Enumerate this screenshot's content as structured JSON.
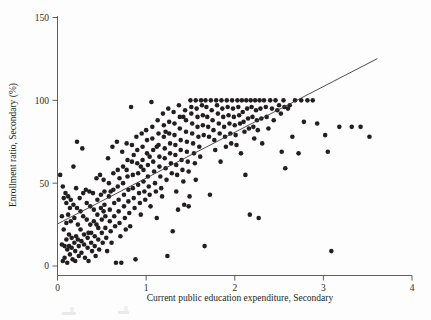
{
  "figure": {
    "name": "scatter-enrollment-vs-expenditure",
    "background": "#fdfdfd",
    "point_color": "#231f20",
    "axis_color": "#4d4d4d",
    "fit_line_color": "#3a3a3a"
  },
  "chart_data": {
    "type": "scatter",
    "title": "",
    "xlabel": "Current public education expenditure, Secondary",
    "ylabel": "Enrollment ratio, Secondary (%)",
    "xlim": [
      0,
      4
    ],
    "ylim": [
      0,
      150
    ],
    "xticks": [
      0,
      1,
      2,
      3,
      4
    ],
    "yticks": [
      0,
      50,
      100,
      150
    ],
    "xtick_labels": [
      "0",
      "1",
      "2",
      "3",
      "4"
    ],
    "ytick_labels": [
      "0",
      "50",
      "100",
      "150"
    ],
    "grid": false,
    "legend": null,
    "marker": {
      "shape": "circle",
      "size_px": 4.6,
      "color": "#231f20"
    },
    "fit_line": {
      "type": "linear",
      "x_start": 0.0,
      "y_start": 25.4,
      "x_end": 3.61,
      "y_end": 125.2,
      "slope": 27.6,
      "intercept": 25.4
    },
    "n_points": 338,
    "points": [
      [
        0.03,
        55
      ],
      [
        0.05,
        30
      ],
      [
        0.05,
        13
      ],
      [
        0.06,
        3
      ],
      [
        0.07,
        41
      ],
      [
        0.07,
        22
      ],
      [
        0.08,
        12
      ],
      [
        0.08,
        5
      ],
      [
        0.09,
        44
      ],
      [
        0.1,
        38
      ],
      [
        0.1,
        26
      ],
      [
        0.1,
        16
      ],
      [
        0.11,
        10
      ],
      [
        0.11,
        2
      ],
      [
        0.12,
        42
      ],
      [
        0.12,
        31
      ],
      [
        0.13,
        19
      ],
      [
        0.13,
        12
      ],
      [
        0.14,
        7
      ],
      [
        0.15,
        40
      ],
      [
        0.15,
        27
      ],
      [
        0.16,
        17
      ],
      [
        0.16,
        11
      ],
      [
        0.17,
        4
      ],
      [
        0.18,
        60
      ],
      [
        0.18,
        37
      ],
      [
        0.19,
        29
      ],
      [
        0.19,
        14
      ],
      [
        0.2,
        9
      ],
      [
        0.2,
        3
      ],
      [
        0.21,
        47
      ],
      [
        0.22,
        75
      ],
      [
        0.22,
        35
      ],
      [
        0.23,
        25
      ],
      [
        0.23,
        16
      ],
      [
        0.24,
        12
      ],
      [
        0.24,
        6
      ],
      [
        0.25,
        41
      ],
      [
        0.26,
        33
      ],
      [
        0.26,
        22
      ],
      [
        0.27,
        15
      ],
      [
        0.27,
        8
      ],
      [
        0.28,
        71
      ],
      [
        0.29,
        44
      ],
      [
        0.29,
        30
      ],
      [
        0.3,
        19
      ],
      [
        0.3,
        13
      ],
      [
        0.31,
        5
      ],
      [
        0.32,
        46
      ],
      [
        0.33,
        38
      ],
      [
        0.33,
        28
      ],
      [
        0.34,
        17
      ],
      [
        0.34,
        11
      ],
      [
        0.35,
        3
      ],
      [
        0.36,
        45
      ],
      [
        0.37,
        36
      ],
      [
        0.37,
        25
      ],
      [
        0.38,
        20
      ],
      [
        0.38,
        14
      ],
      [
        0.39,
        9
      ],
      [
        0.4,
        44
      ],
      [
        0.41,
        34
      ],
      [
        0.41,
        27
      ],
      [
        0.42,
        18
      ],
      [
        0.42,
        12
      ],
      [
        0.43,
        6
      ],
      [
        0.44,
        53
      ],
      [
        0.45,
        40
      ],
      [
        0.45,
        31
      ],
      [
        0.46,
        23
      ],
      [
        0.46,
        16
      ],
      [
        0.47,
        10
      ],
      [
        0.48,
        55
      ],
      [
        0.49,
        43
      ],
      [
        0.49,
        35
      ],
      [
        0.5,
        28
      ],
      [
        0.5,
        20
      ],
      [
        0.51,
        14
      ],
      [
        0.52,
        52
      ],
      [
        0.53,
        45
      ],
      [
        0.53,
        37
      ],
      [
        0.54,
        30
      ],
      [
        0.54,
        23
      ],
      [
        0.55,
        17
      ],
      [
        0.56,
        9
      ],
      [
        0.57,
        65
      ],
      [
        0.58,
        50
      ],
      [
        0.58,
        42
      ],
      [
        0.59,
        34
      ],
      [
        0.59,
        27
      ],
      [
        0.6,
        21
      ],
      [
        0.61,
        14
      ],
      [
        0.62,
        72
      ],
      [
        0.63,
        56
      ],
      [
        0.63,
        46
      ],
      [
        0.64,
        38
      ],
      [
        0.64,
        30
      ],
      [
        0.65,
        24
      ],
      [
        0.66,
        2
      ],
      [
        0.67,
        75
      ],
      [
        0.68,
        58
      ],
      [
        0.68,
        48
      ],
      [
        0.69,
        40
      ],
      [
        0.69,
        33
      ],
      [
        0.7,
        26
      ],
      [
        0.71,
        18
      ],
      [
        0.72,
        2
      ],
      [
        0.73,
        69
      ],
      [
        0.74,
        60
      ],
      [
        0.74,
        50
      ],
      [
        0.75,
        43
      ],
      [
        0.75,
        36
      ],
      [
        0.76,
        29
      ],
      [
        0.77,
        22
      ],
      [
        0.78,
        74
      ],
      [
        0.79,
        64
      ],
      [
        0.79,
        54
      ],
      [
        0.8,
        46
      ],
      [
        0.8,
        39
      ],
      [
        0.81,
        32
      ],
      [
        0.82,
        24
      ],
      [
        0.83,
        96
      ],
      [
        0.84,
        73
      ],
      [
        0.84,
        63
      ],
      [
        0.85,
        55
      ],
      [
        0.85,
        47
      ],
      [
        0.86,
        41
      ],
      [
        0.87,
        35
      ],
      [
        0.88,
        4
      ],
      [
        0.89,
        78
      ],
      [
        0.9,
        70
      ],
      [
        0.9,
        62
      ],
      [
        0.91,
        56
      ],
      [
        0.91,
        49
      ],
      [
        0.92,
        44
      ],
      [
        0.93,
        38
      ],
      [
        0.94,
        31
      ],
      [
        0.95,
        80
      ],
      [
        0.96,
        72
      ],
      [
        0.96,
        64
      ],
      [
        0.97,
        58
      ],
      [
        0.97,
        51
      ],
      [
        0.98,
        45
      ],
      [
        0.99,
        40
      ],
      [
        1.0,
        82
      ],
      [
        1.01,
        76
      ],
      [
        1.01,
        68
      ],
      [
        1.02,
        61
      ],
      [
        1.02,
        54
      ],
      [
        1.03,
        48
      ],
      [
        1.04,
        43
      ],
      [
        1.05,
        36
      ],
      [
        1.06,
        99
      ],
      [
        1.07,
        84
      ],
      [
        1.07,
        77
      ],
      [
        1.08,
        70
      ],
      [
        1.08,
        63
      ],
      [
        1.09,
        57
      ],
      [
        1.1,
        50
      ],
      [
        1.11,
        45
      ],
      [
        1.12,
        29
      ],
      [
        1.13,
        88
      ],
      [
        1.14,
        80
      ],
      [
        1.14,
        73
      ],
      [
        1.15,
        66
      ],
      [
        1.15,
        60
      ],
      [
        1.16,
        54
      ],
      [
        1.17,
        47
      ],
      [
        1.18,
        42
      ],
      [
        1.19,
        92
      ],
      [
        1.2,
        85
      ],
      [
        1.2,
        78
      ],
      [
        1.21,
        71
      ],
      [
        1.21,
        65
      ],
      [
        1.22,
        59
      ],
      [
        1.23,
        52
      ],
      [
        1.24,
        6
      ],
      [
        1.25,
        95
      ],
      [
        1.26,
        87
      ],
      [
        1.26,
        80
      ],
      [
        1.27,
        74
      ],
      [
        1.27,
        68
      ],
      [
        1.28,
        62
      ],
      [
        1.29,
        56
      ],
      [
        1.3,
        21
      ],
      [
        1.31,
        93
      ],
      [
        1.32,
        86
      ],
      [
        1.32,
        79
      ],
      [
        1.33,
        73
      ],
      [
        1.33,
        67
      ],
      [
        1.34,
        61
      ],
      [
        1.35,
        55
      ],
      [
        1.36,
        34
      ],
      [
        1.37,
        97
      ],
      [
        1.38,
        90
      ],
      [
        1.38,
        83
      ],
      [
        1.39,
        76
      ],
      [
        1.39,
        70
      ],
      [
        1.4,
        64
      ],
      [
        1.41,
        58
      ],
      [
        1.42,
        51
      ],
      [
        1.43,
        37
      ],
      [
        1.44,
        94
      ],
      [
        1.45,
        88
      ],
      [
        1.45,
        81
      ],
      [
        1.46,
        75
      ],
      [
        1.46,
        69
      ],
      [
        1.47,
        63
      ],
      [
        1.48,
        57
      ],
      [
        1.49,
        42
      ],
      [
        1.5,
        100
      ],
      [
        1.51,
        96
      ],
      [
        1.51,
        92
      ],
      [
        1.52,
        86
      ],
      [
        1.52,
        80
      ],
      [
        1.53,
        74
      ],
      [
        1.54,
        68
      ],
      [
        1.55,
        62
      ],
      [
        1.56,
        100
      ],
      [
        1.57,
        95
      ],
      [
        1.58,
        90
      ],
      [
        1.58,
        84
      ],
      [
        1.59,
        78
      ],
      [
        1.6,
        72
      ],
      [
        1.61,
        66
      ],
      [
        1.62,
        100
      ],
      [
        1.63,
        97
      ],
      [
        1.64,
        91
      ],
      [
        1.64,
        85
      ],
      [
        1.65,
        79
      ],
      [
        1.66,
        12
      ],
      [
        1.67,
        100
      ],
      [
        1.68,
        96
      ],
      [
        1.69,
        90
      ],
      [
        1.7,
        84
      ],
      [
        1.71,
        78
      ],
      [
        1.72,
        43
      ],
      [
        1.73,
        100
      ],
      [
        1.74,
        94
      ],
      [
        1.75,
        88
      ],
      [
        1.76,
        82
      ],
      [
        1.77,
        76
      ],
      [
        1.78,
        70
      ],
      [
        1.79,
        100
      ],
      [
        1.8,
        97
      ],
      [
        1.81,
        92
      ],
      [
        1.82,
        86
      ],
      [
        1.83,
        80
      ],
      [
        1.84,
        63
      ],
      [
        1.85,
        100
      ],
      [
        1.86,
        95
      ],
      [
        1.87,
        90
      ],
      [
        1.88,
        84
      ],
      [
        1.89,
        78
      ],
      [
        1.9,
        72
      ],
      [
        1.91,
        100
      ],
      [
        1.92,
        96
      ],
      [
        1.93,
        91
      ],
      [
        1.94,
        86
      ],
      [
        1.95,
        80
      ],
      [
        1.96,
        74
      ],
      [
        1.97,
        100
      ],
      [
        1.98,
        95
      ],
      [
        1.99,
        90
      ],
      [
        2.0,
        85
      ],
      [
        2.01,
        79
      ],
      [
        2.02,
        73
      ],
      [
        2.03,
        100
      ],
      [
        2.04,
        96
      ],
      [
        2.05,
        91
      ],
      [
        2.06,
        86
      ],
      [
        2.07,
        68
      ],
      [
        2.08,
        100
      ],
      [
        2.09,
        93
      ],
      [
        2.1,
        87
      ],
      [
        2.11,
        81
      ],
      [
        2.12,
        55
      ],
      [
        2.13,
        100
      ],
      [
        2.14,
        95
      ],
      [
        2.15,
        89
      ],
      [
        2.16,
        83
      ],
      [
        2.17,
        31
      ],
      [
        2.18,
        100
      ],
      [
        2.19,
        96
      ],
      [
        2.2,
        90
      ],
      [
        2.21,
        84
      ],
      [
        2.22,
        77
      ],
      [
        2.23,
        100
      ],
      [
        2.24,
        94
      ],
      [
        2.25,
        88
      ],
      [
        2.26,
        82
      ],
      [
        2.27,
        29
      ],
      [
        2.28,
        100
      ],
      [
        2.29,
        95
      ],
      [
        2.3,
        89
      ],
      [
        2.31,
        74
      ],
      [
        2.33,
        100
      ],
      [
        2.35,
        96
      ],
      [
        2.36,
        90
      ],
      [
        2.38,
        83
      ],
      [
        2.4,
        100
      ],
      [
        2.42,
        95
      ],
      [
        2.44,
        88
      ],
      [
        2.46,
        100
      ],
      [
        2.48,
        94
      ],
      [
        2.5,
        97
      ],
      [
        2.52,
        92
      ],
      [
        2.53,
        69
      ],
      [
        2.55,
        100
      ],
      [
        2.56,
        96
      ],
      [
        2.57,
        59
      ],
      [
        2.6,
        95
      ],
      [
        2.62,
        97
      ],
      [
        2.65,
        78
      ],
      [
        2.68,
        100
      ],
      [
        2.72,
        68
      ],
      [
        2.75,
        100
      ],
      [
        2.78,
        87
      ],
      [
        2.82,
        100
      ],
      [
        2.88,
        100
      ],
      [
        2.93,
        86
      ],
      [
        3.02,
        79
      ],
      [
        3.05,
        69
      ],
      [
        3.09,
        9
      ],
      [
        3.18,
        84
      ],
      [
        3.32,
        84
      ],
      [
        3.42,
        84
      ],
      [
        3.52,
        78
      ],
      [
        0.06,
        48
      ],
      [
        0.14,
        35
      ],
      [
        0.21,
        18
      ],
      [
        0.35,
        20
      ],
      [
        0.44,
        25
      ],
      [
        0.52,
        33
      ],
      [
        0.6,
        45
      ],
      [
        0.7,
        53
      ],
      [
        0.78,
        58
      ],
      [
        0.86,
        67
      ],
      [
        0.94,
        60
      ],
      [
        1.04,
        66
      ],
      [
        1.12,
        72
      ],
      [
        1.22,
        81
      ],
      [
        1.34,
        45
      ],
      [
        1.42,
        90
      ],
      [
        1.48,
        36
      ],
      [
        1.56,
        52
      ]
    ]
  }
}
